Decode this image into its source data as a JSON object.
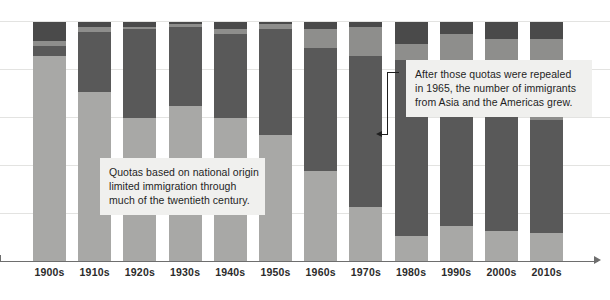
{
  "chart_data": {
    "type": "bar",
    "stacked": "100%",
    "title": "",
    "subtitle": "",
    "xlabel": "",
    "ylabel": "",
    "ylim": [
      0,
      100
    ],
    "grid": true,
    "gridlines": [
      0,
      20,
      40,
      60,
      80,
      100
    ],
    "legend_position": "none",
    "categories": [
      "1900s",
      "1910s",
      "1920s",
      "1930s",
      "1940s",
      "1950s",
      "1960s",
      "1970s",
      "1980s",
      "1990s",
      "2000s",
      "2010s"
    ],
    "series": [
      {
        "name": "Europe",
        "color": "#a8a8a6",
        "values": [
          86,
          71,
          60,
          65,
          60,
          53,
          38,
          23,
          11,
          15,
          13,
          12
        ]
      },
      {
        "name": "Asia",
        "color": "#595959",
        "values": [
          4,
          25,
          37,
          33,
          35,
          44,
          51,
          63,
          73,
          68,
          50,
          47
        ]
      },
      {
        "name": "Americas",
        "color": "#8e8e8c",
        "values": [
          2,
          2,
          1,
          1,
          2,
          2,
          8,
          12,
          7,
          12,
          30,
          34
        ]
      },
      {
        "name": "Other",
        "color": "#4a4a4a",
        "values": [
          8,
          2,
          2,
          1,
          3,
          1,
          3,
          2,
          9,
          5,
          7,
          7
        ]
      }
    ]
  },
  "axis": {
    "tick_labels": [
      "1900s",
      "1910s",
      "1920s",
      "1930s",
      "1940s",
      "1950s",
      "1960s",
      "1970s",
      "1980s",
      "1990s",
      "2000s",
      "2010s"
    ],
    "arrow": "axis-arrow-right"
  },
  "annotations": [
    {
      "id": "quotas",
      "lines": [
        "Quotas based on national origin",
        "limited immigration through",
        "much of the twentieth century."
      ]
    },
    {
      "id": "repeal",
      "lines": [
        "After those quotas were repealed",
        "in 1965, the number of immigrants",
        "from Asia and the Americas grew."
      ]
    }
  ],
  "colors": {
    "background": "#ffffff",
    "gridline": "#e3e3e1",
    "axis": "#6e6e6e",
    "annotation_bg": "#f0f0ee",
    "annotation_text": "#1f1f1f",
    "tick_text": "#2b2b2b",
    "leader": "#1f1f1f"
  }
}
